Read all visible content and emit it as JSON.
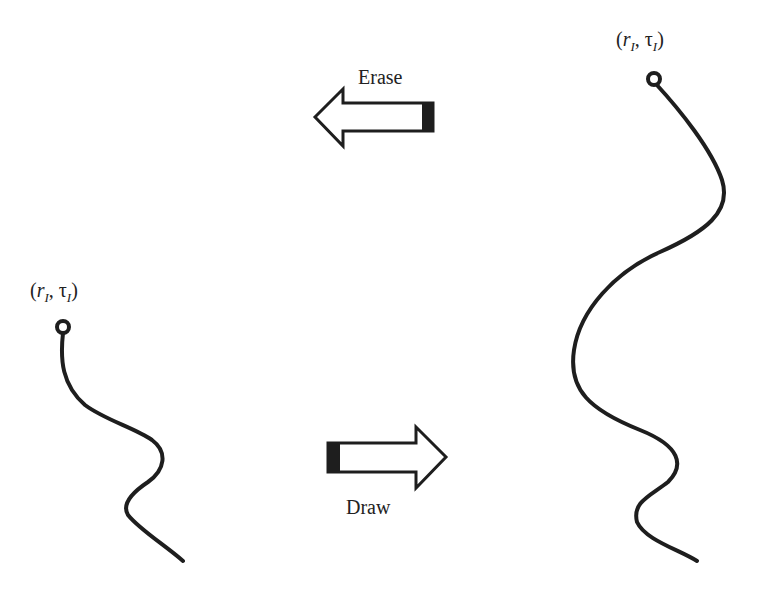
{
  "diagram": {
    "left_path": {
      "label_parts": {
        "open": "(",
        "r": "r",
        "r_sub": "I",
        "sep": ", ",
        "tau": "τ",
        "tau_sub": "I",
        "close": ")"
      },
      "description": "short path"
    },
    "right_path": {
      "label_parts": {
        "open": "(",
        "r": "r",
        "r_sub": "I",
        "sep": ", ",
        "tau": "τ",
        "tau_sub": "I",
        "close": ")"
      },
      "description": "long path"
    },
    "arrows": {
      "erase": {
        "label": "Erase",
        "direction": "left"
      },
      "draw": {
        "label": "Draw",
        "direction": "right"
      }
    },
    "colors": {
      "stroke": "#1e1e1e",
      "background": "#ffffff"
    }
  }
}
